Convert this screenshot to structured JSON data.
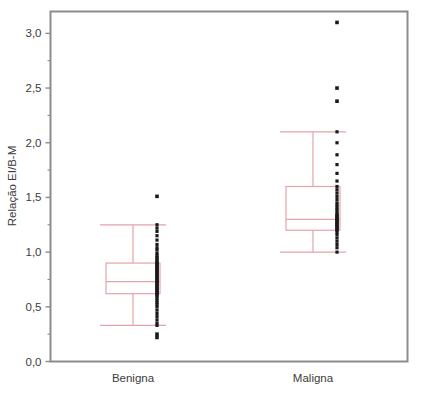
{
  "chart_data": {
    "type": "boxplot",
    "title": "",
    "xlabel": "",
    "ylabel": "Relação EI/B-M",
    "categories": [
      "Benigna",
      "Maligna"
    ],
    "ylim": [
      0.0,
      3.2
    ],
    "ytick_values": [
      0.0,
      0.5,
      1.0,
      1.5,
      2.0,
      2.5,
      3.0
    ],
    "ytick_labels": [
      "0,0",
      "0,5",
      "1,0",
      "1,5",
      "2,0",
      "2,5",
      "3,0"
    ],
    "yminor_tick_values": [
      0.25,
      0.75,
      1.25,
      1.75,
      2.25,
      2.75
    ],
    "grid": false,
    "legend": false,
    "box_line_color": "#e4a3ab",
    "point_color": "#1a1a1a",
    "frame_color": "#8c8c8c",
    "text_color": "#3b3b3b",
    "series": [
      {
        "name": "Benigna",
        "whisker_low": 0.33,
        "q1": 0.62,
        "median": 0.73,
        "q3": 0.9,
        "whisker_high": 1.25,
        "outliers": [
          1.51,
          0.25,
          0.22
        ],
        "points": [
          1.25,
          1.22,
          1.19,
          1.15,
          1.11,
          1.07,
          1.04,
          1.02,
          0.99,
          0.97,
          0.95,
          0.94,
          0.92,
          0.91,
          0.9,
          0.89,
          0.88,
          0.87,
          0.86,
          0.85,
          0.84,
          0.83,
          0.82,
          0.81,
          0.8,
          0.79,
          0.78,
          0.77,
          0.76,
          0.75,
          0.74,
          0.73,
          0.72,
          0.71,
          0.7,
          0.69,
          0.68,
          0.67,
          0.66,
          0.65,
          0.64,
          0.63,
          0.62,
          0.61,
          0.6,
          0.58,
          0.56,
          0.54,
          0.52,
          0.5,
          0.47,
          0.44,
          0.41,
          0.38,
          0.35,
          0.33
        ]
      },
      {
        "name": "Maligna",
        "whisker_low": 1.0,
        "q1": 1.2,
        "median": 1.3,
        "q3": 1.6,
        "whisker_high": 2.1,
        "outliers": [
          3.1,
          2.5,
          2.38
        ],
        "points": [
          2.1,
          2.0,
          1.89,
          1.8,
          1.72,
          1.65,
          1.6,
          1.57,
          1.54,
          1.51,
          1.48,
          1.45,
          1.43,
          1.41,
          1.39,
          1.37,
          1.35,
          1.34,
          1.33,
          1.32,
          1.31,
          1.3,
          1.29,
          1.28,
          1.27,
          1.26,
          1.25,
          1.24,
          1.23,
          1.22,
          1.21,
          1.2,
          1.18,
          1.16,
          1.13,
          1.1,
          1.07,
          1.04,
          1.0
        ]
      }
    ]
  },
  "axis": {
    "y_label": "Relação EI/B-M"
  }
}
